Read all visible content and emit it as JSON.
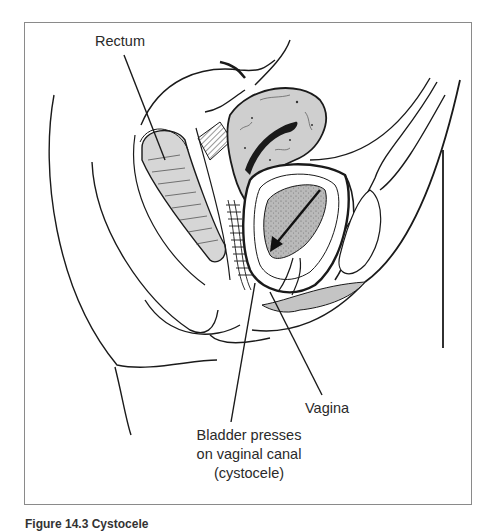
{
  "figure": {
    "labels": {
      "rectum": "Rectum",
      "vagina": "Vagina",
      "bladder_line1": "Bladder presses",
      "bladder_line2": "on vaginal canal",
      "bladder_line3": "(cystocele)"
    },
    "caption": "Figure 14.3 Cystocele"
  },
  "colors": {
    "line": "#1a1a1a",
    "organ_fill": "#cfcfcf",
    "organ_dark": "#9a9a9a",
    "frame": "#8a8a8a"
  }
}
